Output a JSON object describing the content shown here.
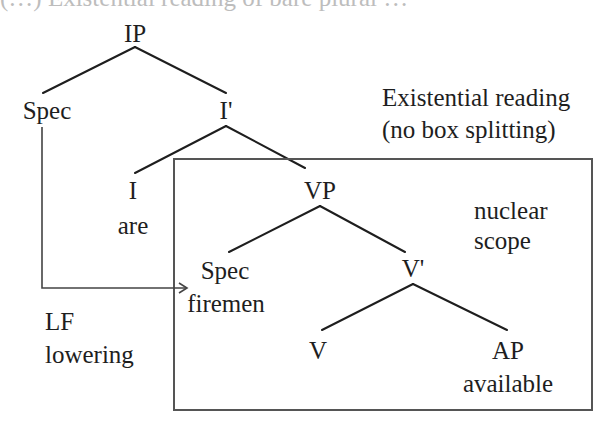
{
  "figure": {
    "caption_clipped": "(…) Existential reading of bare plural …",
    "title_line1": "Existential reading",
    "title_line2": "(no box splitting)",
    "box_label_line1": "nuclear",
    "box_label_line2": "scope",
    "movement_label_line1": "LF",
    "movement_label_line2": "lowering",
    "colors": {
      "ink": "#1e1e1e",
      "box": "#555555",
      "background": "#ffffff"
    }
  },
  "tree": {
    "IP": "IP",
    "spec_ip": "Spec",
    "i_bar": "I'",
    "i_head": "I",
    "i_word": "are",
    "vp": "VP",
    "spec_vp": "Spec",
    "spec_vp_word": "firemen",
    "v_bar": "V'",
    "v_head": "V",
    "ap": "AP",
    "ap_word": "available"
  }
}
